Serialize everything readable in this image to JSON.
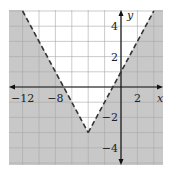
{
  "chart_data": {
    "type": "line",
    "title": "",
    "function": "y = |x + 4| - 3",
    "boundary_style": "dashed",
    "shaded_region": "below boundary (y < |x+4| - 3)",
    "vertex": [
      -4,
      -3
    ],
    "x_intercepts": [
      -7,
      -1
    ],
    "y_intercept": 1,
    "series": [
      {
        "name": "left branch",
        "x": [
          -12,
          -4
        ],
        "y": [
          5,
          -3
        ]
      },
      {
        "name": "right branch",
        "x": [
          -4,
          4
        ],
        "y": [
          -3,
          5
        ]
      }
    ],
    "xlabel": "x",
    "ylabel": "y",
    "x_ticks": [
      -12,
      -8,
      2
    ],
    "x_tick_labels": [
      "−12",
      "−8",
      "2"
    ],
    "y_ticks": [
      4,
      2,
      -2,
      -4
    ],
    "y_tick_labels": [
      "4",
      "2",
      "−2",
      "−4"
    ],
    "xlim": [
      -14,
      5
    ],
    "ylim": [
      -5,
      5
    ],
    "grid": true,
    "x_grid_step": 2,
    "y_grid_step": 1,
    "colors": {
      "shade": "#c8c8c8",
      "grid": "#a8a8a8",
      "axis": "#111111",
      "boundary": "#333333"
    }
  }
}
